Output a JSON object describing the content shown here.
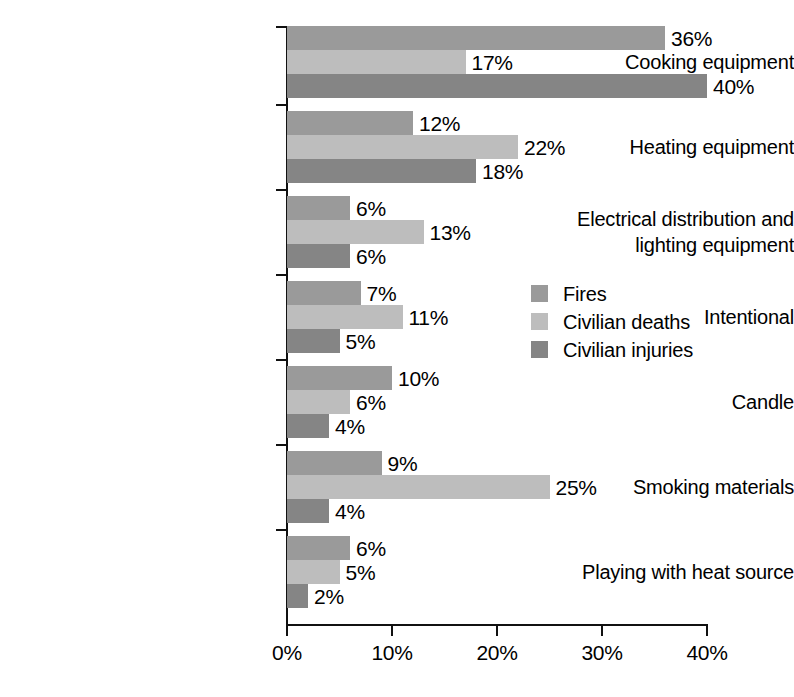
{
  "chart_data": {
    "type": "bar",
    "orientation": "horizontal",
    "title": "",
    "subtitle": "",
    "xlabel": "",
    "ylabel": "",
    "xlim": [
      0,
      40
    ],
    "xunit": "%",
    "grid": false,
    "legend_position": "inside-right",
    "categories": [
      "Cooking equipment",
      "Heating equipment",
      "Electrical distribution and\nlighting equipment",
      "Intentional",
      "Candle",
      "Smoking materials",
      "Playing with heat source"
    ],
    "series": [
      {
        "name": "Fires",
        "color": "#9a9a9a",
        "values": [
          36,
          12,
          6,
          7,
          10,
          9,
          6
        ],
        "labels": [
          "36%",
          "12%",
          "6%",
          "7%",
          "10%",
          "9%",
          "6%"
        ]
      },
      {
        "name": "Civilian deaths",
        "color": "#bdbdbd",
        "values": [
          17,
          22,
          13,
          11,
          6,
          25,
          5
        ],
        "labels": [
          "17%",
          "22%",
          "13%",
          "11%",
          "6%",
          "25%",
          "5%"
        ]
      },
      {
        "name": "Civilian injuries",
        "color": "#858585",
        "values": [
          40,
          18,
          6,
          5,
          4,
          4,
          2
        ],
        "labels": [
          "40%",
          "18%",
          "6%",
          "5%",
          "4%",
          "4%",
          "2%"
        ]
      }
    ],
    "xticks": [
      0,
      10,
      20,
      30,
      40
    ],
    "xtick_labels": [
      "0%",
      "10%",
      "20%",
      "30%",
      "40%"
    ]
  },
  "legend": {
    "items": [
      {
        "label": "Fires",
        "color": "#9a9a9a"
      },
      {
        "label": "Civilian deaths",
        "color": "#bdbdbd"
      },
      {
        "label": "Civilian injuries",
        "color": "#858585"
      }
    ]
  }
}
